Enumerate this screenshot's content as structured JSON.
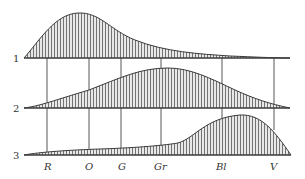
{
  "diagram": {
    "type": "spectral-energy-distribution",
    "curves": [
      {
        "id": "1",
        "label": "1",
        "peak_band": "O"
      },
      {
        "id": "2",
        "label": "2",
        "peak_band": "Gr"
      },
      {
        "id": "3",
        "label": "3",
        "peak_band": "Bl"
      }
    ],
    "bands": [
      {
        "label": "R"
      },
      {
        "label": "O"
      },
      {
        "label": "G"
      },
      {
        "label": "Gr"
      },
      {
        "label": "Bl"
      },
      {
        "label": "V"
      }
    ],
    "colors": {
      "stroke": "#3a3a3a",
      "hatch": "#555555",
      "fill": "#e6e6e6"
    }
  }
}
